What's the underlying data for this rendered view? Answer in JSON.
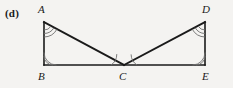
{
  "figure": {
    "part_label": "(d)",
    "type": "geometry-diagram",
    "stroke_color": "#1a1a1a",
    "arc_color": "#6b6b6b",
    "background_color": "#f4f3f1",
    "vertices": [
      {
        "name": "A",
        "label": "A",
        "x": 44,
        "y": 22
      },
      {
        "name": "B",
        "label": "B",
        "x": 44,
        "y": 65
      },
      {
        "name": "C",
        "label": "C",
        "x": 124,
        "y": 65
      },
      {
        "name": "D",
        "label": "D",
        "x": 205,
        "y": 22
      },
      {
        "name": "E",
        "label": "E",
        "x": 205,
        "y": 65
      }
    ],
    "segments": [
      {
        "name": "AB",
        "from": "A",
        "to": "B"
      },
      {
        "name": "AC",
        "from": "A",
        "to": "C"
      },
      {
        "name": "BE",
        "from": "B",
        "to": "E"
      },
      {
        "name": "CD",
        "from": "C",
        "to": "D"
      },
      {
        "name": "DE",
        "from": "D",
        "to": "E"
      }
    ],
    "angle_marks": [
      {
        "name": "angle-A",
        "vertex": "A",
        "arcs": 3
      },
      {
        "name": "angle-B",
        "vertex": "B",
        "arcs": 2
      },
      {
        "name": "angle-BCA",
        "vertex": "C",
        "arcs": 1
      },
      {
        "name": "angle-DCE",
        "vertex": "C",
        "arcs": 1
      },
      {
        "name": "angle-D",
        "vertex": "D",
        "arcs": 3
      },
      {
        "name": "angle-E",
        "vertex": "E",
        "arcs": 2
      }
    ]
  }
}
